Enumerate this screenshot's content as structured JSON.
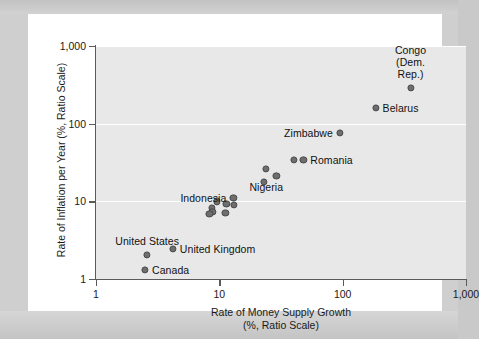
{
  "chart_data": {
    "type": "scatter",
    "title": "",
    "xlabel": "Rate of Money Supply Growth\n(%, Ratio Scale)",
    "xlabel_line1": "Rate of Money Supply Growth",
    "xlabel_line2": "(%, Ratio Scale)",
    "ylabel": "Rate of Inflation per Year (%, Ratio Scale)",
    "xscale": "log",
    "yscale": "log",
    "xlim": [
      1,
      1000
    ],
    "ylim": [
      1,
      1000
    ],
    "grid": "horizontal-white",
    "legend": "none",
    "xticks": [
      {
        "value": 1,
        "label": "1"
      },
      {
        "value": 10,
        "label": "10"
      },
      {
        "value": 100,
        "label": "100"
      },
      {
        "value": 1000,
        "label": "1,000"
      }
    ],
    "yticks": [
      {
        "value": 1,
        "label": "1"
      },
      {
        "value": 10,
        "label": "10"
      },
      {
        "value": 100,
        "label": "100"
      },
      {
        "value": 1000,
        "label": "1,000"
      }
    ],
    "points": [
      {
        "label": "Congo\n(Dem. Rep.)",
        "x": 355,
        "y": 290,
        "label_pos": "above",
        "label_line1": "Congo",
        "label_line2": "(Dem. Rep.)"
      },
      {
        "label": "Belarus",
        "x": 185,
        "y": 160,
        "label_pos": "right"
      },
      {
        "label": "Zimbabwe",
        "x": 95,
        "y": 76,
        "label_pos": "left"
      },
      {
        "label": "Romania",
        "x": 48,
        "y": 34,
        "label_pos": "right"
      },
      {
        "label": "",
        "x": 40,
        "y": 34,
        "label_pos": "none"
      },
      {
        "label": "Nigeria",
        "x": 24,
        "y": 26,
        "label_pos": "below"
      },
      {
        "label": "",
        "x": 29,
        "y": 21,
        "label_pos": "none"
      },
      {
        "label": "",
        "x": 23,
        "y": 18,
        "label_pos": "none"
      },
      {
        "label": "Indonesia",
        "x": 13,
        "y": 11.2,
        "label_pos": "left"
      },
      {
        "label": "",
        "x": 9.6,
        "y": 10.0,
        "label_pos": "none"
      },
      {
        "label": "",
        "x": 11.4,
        "y": 9.3,
        "label_pos": "none"
      },
      {
        "label": "",
        "x": 13.2,
        "y": 9.0,
        "label_pos": "none"
      },
      {
        "label": "",
        "x": 8.7,
        "y": 8.2,
        "label_pos": "none"
      },
      {
        "label": "",
        "x": 8.8,
        "y": 7.3,
        "label_pos": "none"
      },
      {
        "label": "",
        "x": 11.2,
        "y": 7.1,
        "label_pos": "none"
      },
      {
        "label": "",
        "x": 8.3,
        "y": 6.9,
        "label_pos": "none"
      },
      {
        "label": "United Kingdom",
        "x": 4.2,
        "y": 2.45,
        "label_pos": "right"
      },
      {
        "label": "United States",
        "x": 2.6,
        "y": 2.05,
        "label_pos": "above"
      },
      {
        "label": "Canada",
        "x": 2.5,
        "y": 1.3,
        "label_pos": "right"
      }
    ],
    "colors": {
      "marker": "#6e6e6e",
      "marker_edge": "#4a4a4a",
      "plot_background": "#e8e8e8",
      "gridline": "#ffffff",
      "axis": "#5a5a5a",
      "text": "#111111",
      "page_background": "#ffffff",
      "frame": "#cccccc"
    }
  }
}
